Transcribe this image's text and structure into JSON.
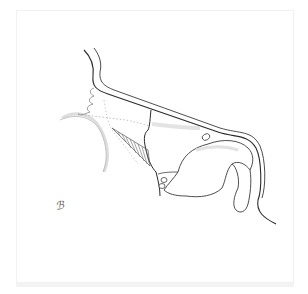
{
  "illustration": {
    "subject": "anatomical line drawing, sagittal view",
    "stroke_color": "#2a2a2a",
    "shade_color": "#d9d9d9",
    "background": "#ffffff",
    "signature": "ℬ"
  }
}
